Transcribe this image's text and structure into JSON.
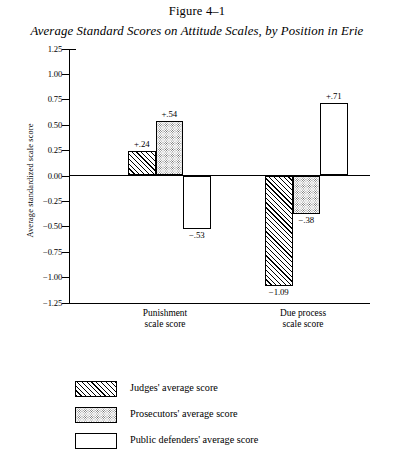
{
  "figure": {
    "number": "Figure 4–1",
    "title": "Average Standard Scores on Attitude Scales, by Position in Erie"
  },
  "chart_data": {
    "type": "bar",
    "title": "Average Standard Scores on Attitude Scales, by Position in Erie",
    "xlabel": "",
    "ylabel": "Average standardized scale score",
    "ylim": [
      -1.25,
      1.25
    ],
    "ytick_step": 0.25,
    "grid": false,
    "legend_position": "bottom-left",
    "categories": [
      "Punishment scale score",
      "Due process scale score"
    ],
    "series": [
      {
        "name": "Judges' average score",
        "pattern": "hatch",
        "values": [
          0.24,
          -1.09
        ],
        "labels": [
          "+.24",
          "−1.09"
        ]
      },
      {
        "name": "Prosecutors' average score",
        "pattern": "dots",
        "values": [
          0.54,
          -0.38
        ],
        "labels": [
          "+.54",
          "−.38"
        ]
      },
      {
        "name": "Public defenders' average score",
        "pattern": "white",
        "values": [
          -0.53,
          0.71
        ],
        "labels": [
          "−.53",
          "+.71"
        ]
      }
    ],
    "ytick_labels": [
      "1.25",
      "1.00",
      "0.75",
      "0.50",
      "0.25",
      "0.00",
      "−0.25",
      "−0.50",
      "−0.75",
      "−1.00",
      "−1.25"
    ],
    "ytick_values": [
      1.25,
      1.0,
      0.75,
      0.5,
      0.25,
      0.0,
      -0.25,
      -0.5,
      -0.75,
      -1.0,
      -1.25
    ]
  },
  "axis": {
    "y_title": "Average standardized scale score"
  },
  "categories_display": [
    {
      "line1": "Punishment",
      "line2": "scale score"
    },
    {
      "line1": "Due process",
      "line2": "scale score"
    }
  ],
  "legend": {
    "items": [
      {
        "label": "Judges' average score"
      },
      {
        "label": "Prosecutors' average score"
      },
      {
        "label": "Public defenders' average score"
      }
    ]
  }
}
